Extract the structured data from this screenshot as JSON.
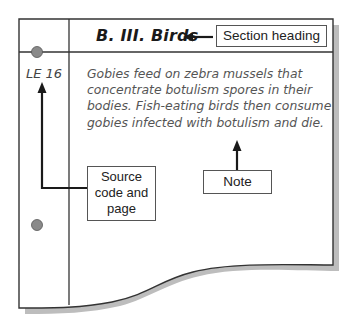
{
  "card": {
    "heading": "B. III. Birds",
    "source_code": "LE 16",
    "note_text": "Gobies feed on zebra mussels that concentrate botulism spores in their bodies. Fish-eating birds then consume gobies infected with botulism and die."
  },
  "callouts": {
    "heading_label": "Section heading",
    "source_label": "Source code and page",
    "note_label": "Note"
  },
  "colors": {
    "card_border": "#333333",
    "shadow": "#b8b8b8",
    "hole": "#8a8a8a",
    "arrow": "#1a1a1a"
  }
}
